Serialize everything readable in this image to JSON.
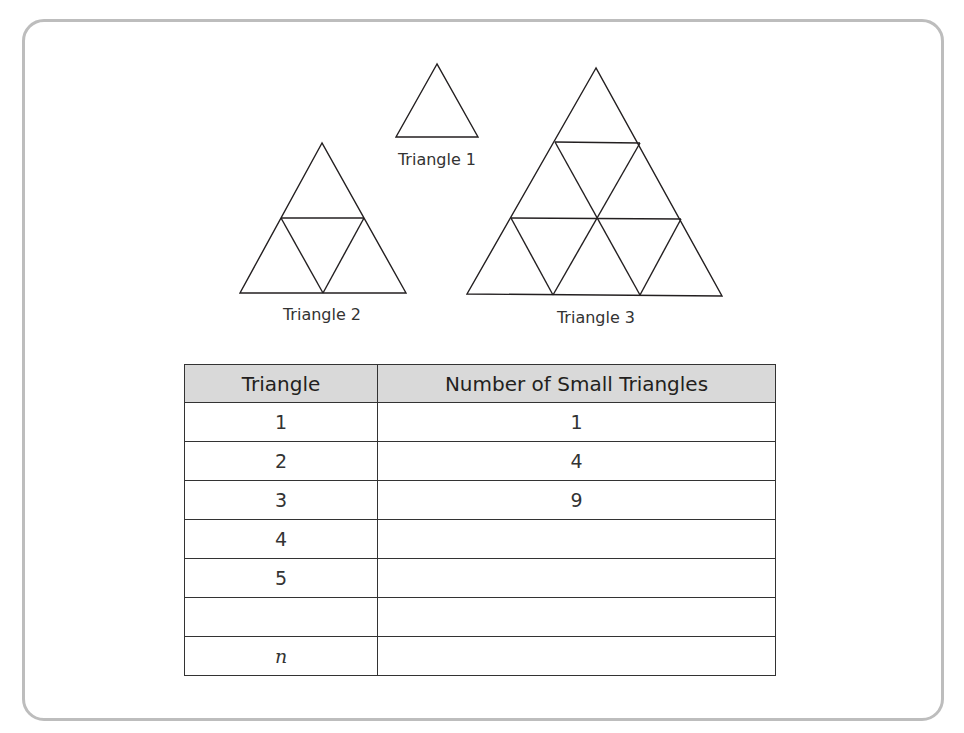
{
  "figure": {
    "triangles": [
      {
        "label": "Triangle 1",
        "rows": 1,
        "small_triangles": 1
      },
      {
        "label": "Triangle 2",
        "rows": 2,
        "small_triangles": 4
      },
      {
        "label": "Triangle 3",
        "rows": 3,
        "small_triangles": 9
      }
    ]
  },
  "table": {
    "headers": [
      "Triangle",
      "Number of Small Triangles"
    ],
    "rows": [
      {
        "triangle": "1",
        "count": "1"
      },
      {
        "triangle": "2",
        "count": "4"
      },
      {
        "triangle": "3",
        "count": "9"
      },
      {
        "triangle": "4",
        "count": ""
      },
      {
        "triangle": "5",
        "count": ""
      },
      {
        "triangle": "",
        "count": ""
      },
      {
        "triangle": "n",
        "count": ""
      }
    ]
  },
  "colors": {
    "frame_border": "#bdbdbd",
    "header_fill": "#d9d9d9",
    "line": "#231f20"
  }
}
